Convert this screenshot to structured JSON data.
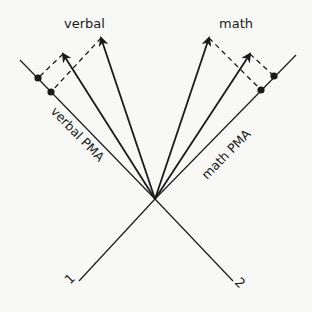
{
  "diagram": {
    "labels": {
      "verbal": "verbal",
      "math": "math",
      "verbal_pma": "verbal PMA",
      "math_pma": "math PMA",
      "axis_1": "1",
      "axis_2": "2"
    },
    "colors": {
      "ink": "#1a1a1a",
      "background": "#f8f8f7"
    },
    "geometry": {
      "origin": [
        155,
        199
      ],
      "axis_1_end": [
        79,
        281
      ],
      "axis_2_end": [
        233,
        281
      ],
      "verbal_pma_end": [
        20,
        60
      ],
      "math_pma_end": [
        296,
        55
      ],
      "verbal_vectors": [
        [
          63,
          54
        ],
        [
          101,
          38
        ]
      ],
      "math_vectors": [
        [
          209,
          38
        ],
        [
          250,
          54
        ]
      ],
      "verbal_projection_points": [
        [
          38,
          78
        ],
        [
          51,
          92
        ]
      ],
      "math_projection_points": [
        [
          274,
          76
        ],
        [
          261,
          90
        ]
      ]
    }
  }
}
